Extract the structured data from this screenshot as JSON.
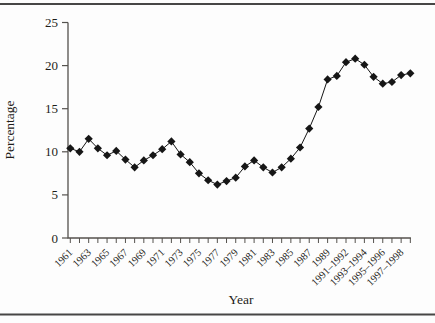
{
  "chart_data": {
    "type": "line",
    "title": "",
    "xlabel": "Year",
    "ylabel": "Percentage",
    "ylim": [
      0,
      25
    ],
    "yticks": [
      25,
      20,
      15,
      10,
      5,
      0
    ],
    "grid": false,
    "legend": "none",
    "marker": "filled-diamond",
    "categories": [
      "1961",
      "1962",
      "1963",
      "1964",
      "1965",
      "1966",
      "1967",
      "1968",
      "1969",
      "1970",
      "1971",
      "1972",
      "1973",
      "1974",
      "1975",
      "1976",
      "1977",
      "1978",
      "1979",
      "1980",
      "1981",
      "1982",
      "1983",
      "1984",
      "1985",
      "1986",
      "1987",
      "1988",
      "1989",
      "1990",
      "1991",
      "1992",
      "1993",
      "1994",
      "1995",
      "1996",
      "1997",
      "1998"
    ],
    "x_tick_labels": [
      "1961",
      "1963",
      "1965",
      "1967",
      "1969",
      "1971",
      "1973",
      "1975",
      "1977",
      "1979",
      "1981",
      "1983",
      "1985",
      "1987",
      "1989",
      "1991–1992",
      "1993–1994",
      "1995–1996",
      "1997–1998"
    ],
    "values": [
      10.4,
      10.0,
      11.5,
      10.4,
      9.6,
      10.1,
      9.1,
      8.2,
      9.0,
      9.6,
      10.3,
      11.2,
      9.7,
      8.8,
      7.5,
      6.7,
      6.2,
      6.6,
      7.0,
      8.3,
      9.0,
      8.2,
      7.6,
      8.2,
      9.2,
      10.5,
      12.7,
      15.2,
      18.4,
      18.8,
      20.4,
      20.8,
      20.1,
      18.7,
      17.9,
      18.1,
      18.9,
      19.1
    ],
    "colors": {
      "background": "#fdfdfd",
      "axis": "#55524e",
      "series": "#161616",
      "text": "#1f1d1a",
      "rule": "#474645"
    },
    "layout": {
      "axis_left": 68,
      "axis_top": 22.5,
      "axis_bottom": 238,
      "x_first_tick": 70.3,
      "x_step": 9.19,
      "x_label_every": 2,
      "x_label_rotation": -45,
      "top_rule_y": 4,
      "bottom_rule_y": 314.5
    }
  }
}
